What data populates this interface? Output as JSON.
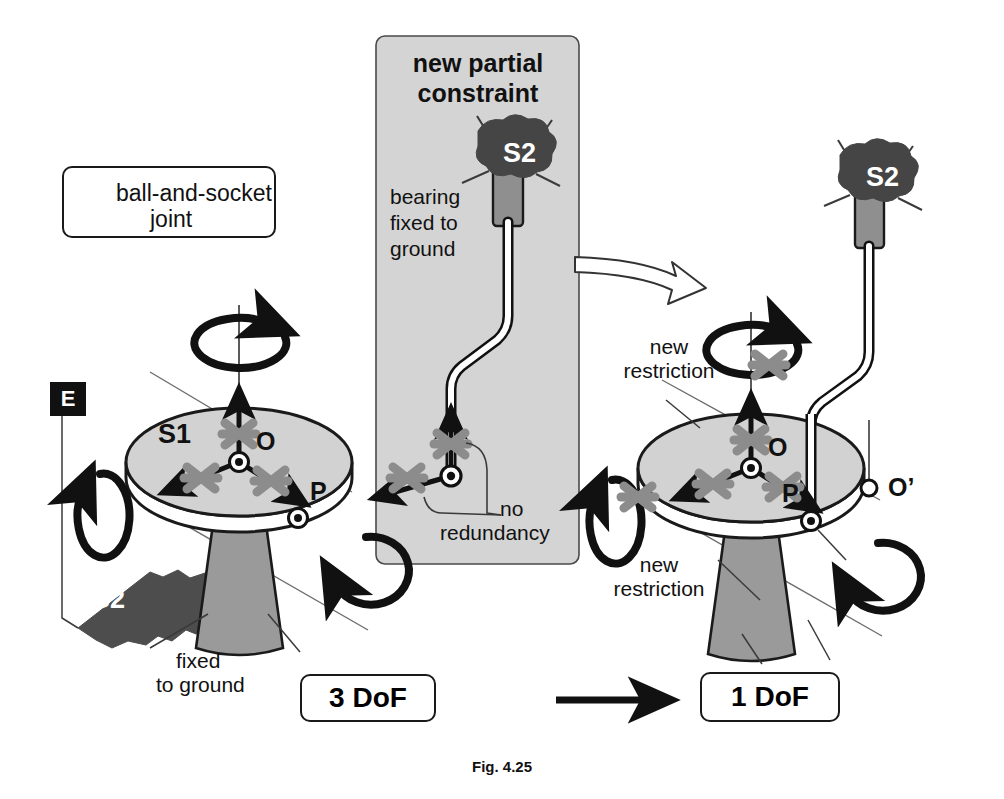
{
  "figure": {
    "caption": "Fig. 4.25",
    "colors": {
      "ink": "#111111",
      "disk_fill": "#d2d2d2",
      "pedestal_fill": "#9a9a9a",
      "panel_fill": "#d4d4d4",
      "ground_patch_fill": "#4d4d4d",
      "blob_fill": "#454545",
      "cross_gray": "#8c8c8c",
      "rod_fill": "#ffffff"
    }
  },
  "legend": {
    "line1": "ball-and-socket",
    "line2": "joint",
    "icon": "ball-and-socket-joint-icon"
  },
  "left_diagram": {
    "body_label": "S1",
    "ground_patch_label": "S2",
    "env_label": "E",
    "joint_o_label": "O",
    "joint_p_label": "P",
    "pedestal_note_line1": "fixed",
    "pedestal_note_line2": "to ground",
    "dof_label": "3 DoF"
  },
  "center_panel": {
    "title_line1": "new partial",
    "title_line2": "constraint",
    "bearing_label": "S2",
    "bearing_note_line1": "bearing",
    "bearing_note_line2": "fixed to",
    "bearing_note_line3": "ground",
    "annotation_line1": "no",
    "annotation_line2": "redundancy"
  },
  "right_diagram": {
    "body_label": "S1",
    "bearing_label": "S2",
    "joint_o_label": "O",
    "joint_p_label": "P",
    "joint_oprime_label": "O’",
    "restriction_top_line1": "new",
    "restriction_top_line2": "restriction",
    "restriction_bottom_line1": "new",
    "restriction_bottom_line2": "restriction",
    "dof_label": "1 DoF"
  },
  "transition": {
    "arrow": "right-arrow"
  }
}
